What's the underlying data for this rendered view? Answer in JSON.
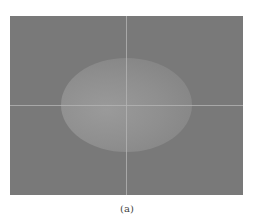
{
  "figure": {
    "caption": "(a)",
    "colors": {
      "background": "#797979",
      "ellipse": "#939393",
      "crosshair": "#b4b4b4"
    }
  }
}
